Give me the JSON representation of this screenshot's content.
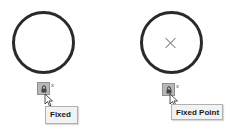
{
  "panels": [
    {
      "id": "left",
      "sketch": {
        "shape": "circle",
        "center_mark": false
      },
      "relation_button": {
        "icon": "lock-icon",
        "close_glyph": "x"
      },
      "tooltip": {
        "text": "Fixed"
      }
    },
    {
      "id": "right",
      "sketch": {
        "shape": "circle",
        "center_mark": true
      },
      "relation_button": {
        "icon": "lock-icon",
        "close_glyph": "x"
      },
      "tooltip": {
        "text": "Fixed Point"
      }
    }
  ],
  "colors": {
    "circle_stroke": "#2a2a2a",
    "button_bg": "#b8b8b8",
    "tooltip_bg": "#f2f2f2"
  }
}
